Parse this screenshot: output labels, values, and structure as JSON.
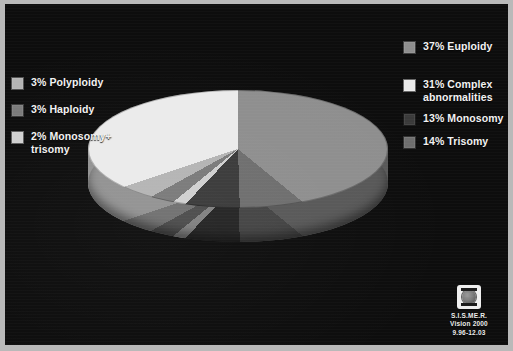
{
  "slide": {
    "background_color": "#0d0d0d",
    "frame_color": "#b9b9b9"
  },
  "chart_data": {
    "type": "pie",
    "title": "",
    "three_d": true,
    "start_angle_deg": 0,
    "direction": "clockwise",
    "categories": [
      "Euploidy",
      "Trisomy",
      "Monosomy",
      "Monosomy+ trisomy",
      "Haploidy",
      "Polyploidy",
      "Complex abnormalities"
    ],
    "values": [
      37,
      14,
      13,
      2,
      3,
      3,
      31
    ],
    "labels": [
      "37% Euploidy",
      "14% Trisomy",
      "13% Monosomy",
      "2% Monosomy+ trisomy",
      "3% Haploidy",
      "3% Polyploidy",
      "31% Complex abnormalities"
    ],
    "colors": [
      "#8e8e8e",
      "#6e6e6e",
      "#3a3a3a",
      "#d0d0d0",
      "#7a7a7a",
      "#b4b4b4",
      "#ebebeb"
    ],
    "units": "percent",
    "total": 103,
    "legend_position": "both-sides",
    "grid": false
  },
  "legend_left": {
    "items": [
      {
        "label": "3% Polyploidy",
        "color": "#b4b4b4"
      },
      {
        "label": "3% Haploidy",
        "color": "#7a7a7a"
      },
      {
        "label": "2% Monosomy+\ntrisomy",
        "color": "#d0d0d0"
      }
    ]
  },
  "legend_right": {
    "items": [
      {
        "label": "37% Euploidy",
        "color": "#8e8e8e"
      },
      {
        "label": "31% Complex\nabnormalities",
        "color": "#ebebeb"
      },
      {
        "label": "13% Monosomy",
        "color": "#3a3a3a"
      },
      {
        "label": "14% Trisomy",
        "color": "#6e6e6e"
      }
    ]
  },
  "logo": {
    "icon": "oocyte-dish-icon",
    "line1": "S.I.S.ME.R.",
    "line2": "Vision 2000",
    "line3": "9.96-12.03"
  }
}
